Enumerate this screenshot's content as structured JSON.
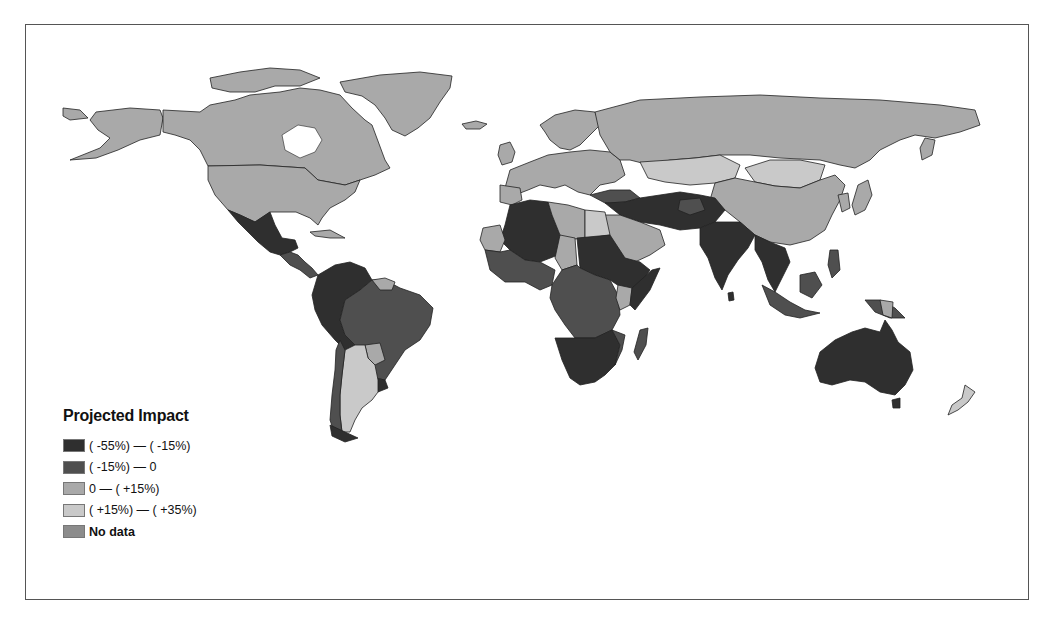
{
  "legend": {
    "title": "Projected Impact",
    "items": [
      {
        "label": "( -55%) — ( -15%)",
        "color": "#2f2f2f",
        "bold": false
      },
      {
        "label": "( -15%) — 0",
        "color": "#4f4f4f",
        "bold": false
      },
      {
        "label": "0 — ( +15%)",
        "color": "#a9a9a9",
        "bold": false
      },
      {
        "label": "( +15%) — ( +35%)",
        "color": "#c9c9c9",
        "bold": false
      },
      {
        "label": "No data",
        "color": "#8c8c8c",
        "bold": true
      }
    ]
  },
  "map": {
    "projection": "equirectangular world map",
    "regions": [
      {
        "name": "North America (Canada, USA, Alaska)",
        "category": "0 — ( +15%)"
      },
      {
        "name": "Greenland",
        "category": "0 — ( +15%)"
      },
      {
        "name": "Mexico",
        "category": "( -55%) — ( -15%)"
      },
      {
        "name": "Central America",
        "category": "( -15%) — 0"
      },
      {
        "name": "Northern South America / Brazil",
        "category": "( -15%) — 0"
      },
      {
        "name": "Andean South America (Colombia, Peru, Bolivia)",
        "category": "( -55%) — ( -15%)"
      },
      {
        "name": "Argentina",
        "category": "( +15%) — ( +35%)"
      },
      {
        "name": "Chile",
        "category": "( -15%) — 0"
      },
      {
        "name": "Europe",
        "category": "0 — ( +15%)"
      },
      {
        "name": "Russia",
        "category": "0 — ( +15%)"
      },
      {
        "name": "Kazakhstan / Mongolia",
        "category": "( +15%) — ( +35%)"
      },
      {
        "name": "China",
        "category": "0 — ( +15%)"
      },
      {
        "name": "North Africa / Sahel",
        "category": "( -55%) — ( -15%)"
      },
      {
        "name": "Libya / Egypt",
        "category": "0 — ( +15%)"
      },
      {
        "name": "Arabian Peninsula",
        "category": "0 — ( +15%)"
      },
      {
        "name": "Central Africa",
        "category": "( -15%) — 0"
      },
      {
        "name": "Southern Africa",
        "category": "( -55%) — ( -15%)"
      },
      {
        "name": "Madagascar",
        "category": "( -15%) — 0"
      },
      {
        "name": "Middle East / South Asia (Iran, Pakistan, India)",
        "category": "( -55%) — ( -15%)"
      },
      {
        "name": "Southeast Asia",
        "category": "( -55%) — ( -15%)"
      },
      {
        "name": "Indonesia / Philippines",
        "category": "( -15%) — 0"
      },
      {
        "name": "Australia",
        "category": "( -55%) — ( -15%)"
      },
      {
        "name": "New Zealand",
        "category": "( +15%) — ( +35%)"
      },
      {
        "name": "Japan / Korea",
        "category": "0 — ( +15%)"
      }
    ]
  }
}
